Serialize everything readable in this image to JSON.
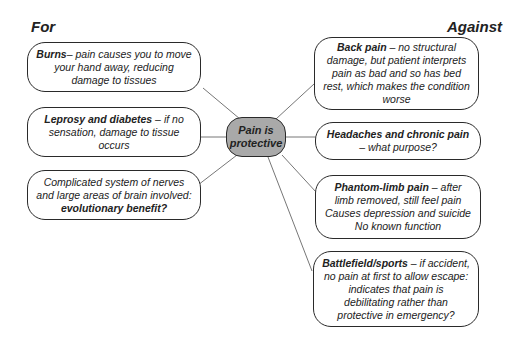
{
  "diagram": {
    "center": {
      "line1": "Pain is",
      "line2": "protective"
    },
    "for": {
      "heading": "For",
      "items": [
        {
          "bold": "Burns",
          "text": "– pain causes you to move your hand away, reducing damage to tissues"
        },
        {
          "bold": "Leprosy and diabetes",
          "text": " – if no sensation, damage to tissue occurs"
        },
        {
          "pre": "Complicated system of nerves and large areas of brain involved: ",
          "bold": "evolutionary benefit?"
        }
      ]
    },
    "against": {
      "heading": "Against",
      "items": [
        {
          "bold": "Back pain",
          "text": " – no structural damage, but patient interprets pain as bad and so has bed rest, which makes the condition worse"
        },
        {
          "bold": "Headaches and chronic pain",
          "text": " – what purpose?"
        },
        {
          "bold": "Phantom-limb pain",
          "text": " – after limb removed, still feel pain Causes depression and suicide No known function"
        },
        {
          "bold": "Battlefield/sports",
          "text": " – if accident, no pain at first to allow escape: indicates that pain is debilitating rather than protective in emergency?"
        }
      ]
    },
    "colors": {
      "center_fill": "#a9a9a9",
      "border": "#2a2a2a",
      "line": "#666666"
    }
  }
}
